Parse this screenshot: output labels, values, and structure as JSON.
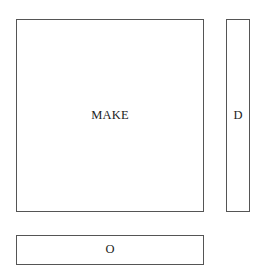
{
  "diagram": {
    "boxes": [
      {
        "id": "make",
        "label": "MAKE"
      },
      {
        "id": "d",
        "label": "D"
      },
      {
        "id": "o",
        "label": "O"
      }
    ]
  }
}
